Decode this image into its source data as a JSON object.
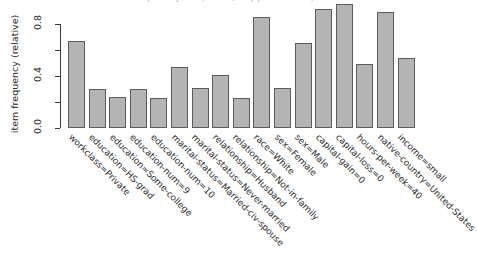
{
  "chart_data": {
    "type": "bar",
    "title": "",
    "xlabel": "",
    "ylabel": "item frequency (relative)",
    "ylim": [
      0,
      1.0
    ],
    "grid": false,
    "legend": "none",
    "ytick_labels": [
      "0.0",
      "0.4",
      "0.8"
    ],
    "ytick_values": [
      0.0,
      0.4,
      0.8
    ],
    "minor_ticks": [
      0.2,
      0.6
    ],
    "bar_fill_color": "#b4b4b4",
    "bar_border_color": "#5c5c5c",
    "background_color": "#ffffff",
    "categories": [
      "workclass=Private",
      "education=HS-grad",
      "education=Some-college",
      "education-num=9",
      "education-num=10",
      "marital-status=Married-civ-spouse",
      "marital-status=Never-married",
      "relationship=Husband",
      "relationship=Not-in-family",
      "race=White",
      "sex=Female",
      "sex=Male",
      "capital-gain=0",
      "capital-loss=0",
      "hours-per-week=40",
      "native-country=United-States",
      "income=small"
    ],
    "values": [
      0.67,
      0.3,
      0.24,
      0.3,
      0.23,
      0.47,
      0.31,
      0.41,
      0.23,
      0.855,
      0.31,
      0.655,
      0.915,
      0.955,
      0.49,
      0.895,
      0.54
    ]
  },
  "header": {
    "cropped_title": "itemFrequencyPlot(Adult, support = 0.2)"
  }
}
